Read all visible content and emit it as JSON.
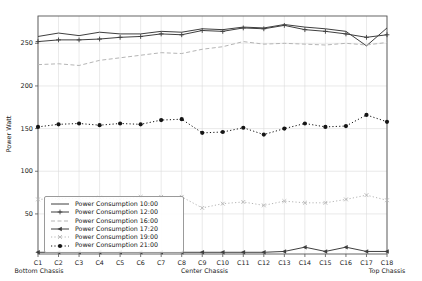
{
  "chart_data": {
    "type": "line",
    "title": "",
    "ylabel": "Power Watt",
    "xlabel": "",
    "categories": [
      "C1",
      "C2",
      "C3",
      "C4",
      "C5",
      "C6",
      "C7",
      "C8",
      "C9",
      "C10",
      "C11",
      "C12",
      "C13",
      "C14",
      "C15",
      "C16",
      "C17",
      "C18"
    ],
    "x_group_labels": [
      "Bottom Chassis",
      "Center Chassis",
      "Top Chassis"
    ],
    "ylim": [
      3,
      282
    ],
    "yticks": [
      50,
      100,
      150,
      200,
      250
    ],
    "grid": true,
    "legend_position": "lower-left",
    "colors": {
      "dark_line": "#3f3f3f",
      "light_line": "#b5b5b5",
      "black_line": "#151515",
      "gridline": "#dcdcdc",
      "spine": "#555555",
      "tick_text": "#1a1a1a"
    },
    "series": [
      {
        "name": "Power Consumption 10:00",
        "color": "#3f3f3f",
        "dash": "solid",
        "marker": "none",
        "values": [
          258,
          262,
          259,
          263,
          261,
          261,
          264,
          263,
          267,
          266,
          269,
          268,
          272,
          269,
          267,
          264,
          247,
          268
        ]
      },
      {
        "name": "Power Consumption 12:00",
        "color": "#3f3f3f",
        "dash": "solid",
        "marker": "plus",
        "values": [
          252,
          254,
          254,
          255,
          257,
          258,
          261,
          260,
          265,
          264,
          268,
          267,
          271,
          266,
          264,
          261,
          257,
          260
        ]
      },
      {
        "name": "Power Consumption 16:00",
        "color": "#b5b5b5",
        "dash": "dashed",
        "marker": "none",
        "values": [
          225,
          226,
          224,
          230,
          233,
          236,
          239,
          238,
          243,
          246,
          252,
          249,
          250,
          249,
          248,
          250,
          248,
          251
        ]
      },
      {
        "name": "Power Consumption 17:20",
        "color": "#3f3f3f",
        "dash": "solid",
        "marker": "tri-left",
        "values": [
          5,
          5,
          5,
          5,
          5,
          5,
          5,
          5,
          5,
          5,
          5,
          5,
          6,
          11,
          6,
          11,
          6,
          6
        ]
      },
      {
        "name": "Power Consumption 19:00",
        "color": "#b5b5b5",
        "dash": "dotted",
        "marker": "x",
        "values": [
          67,
          68,
          68,
          69,
          67,
          70,
          70,
          70,
          57,
          62,
          64,
          60,
          65,
          63,
          63,
          67,
          72,
          66
        ]
      },
      {
        "name": "Power Consumption 21:00",
        "color": "#151515",
        "dash": "dotted",
        "marker": "circle",
        "values": [
          152,
          155,
          156,
          154,
          156,
          155,
          160,
          161,
          145,
          146,
          151,
          143,
          150,
          156,
          152,
          153,
          166,
          158
        ]
      }
    ]
  }
}
